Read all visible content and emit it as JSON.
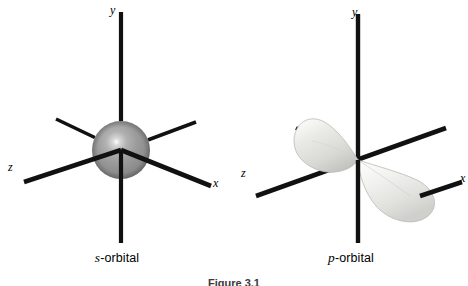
{
  "figure": {
    "background_color": "#ffffff",
    "caption": "Figure 3.1",
    "panels": [
      {
        "id": "s-orbital",
        "caption_italic": "s",
        "caption_rest": "-orbital",
        "orbital_type": "s",
        "shape": "sphere",
        "surface_color": "#9a9a9a",
        "highlight_color": "#ffffff",
        "axes": [
          {
            "name": "y",
            "label": "y",
            "label_x": 110,
            "label_y": 4
          },
          {
            "name": "z",
            "label": "z",
            "label_x": 8,
            "label_y": 161
          },
          {
            "name": "x",
            "label": "x",
            "label_x": 213,
            "label_y": 177
          }
        ]
      },
      {
        "id": "p-orbital",
        "caption_italic": "p",
        "caption_rest": "-orbital",
        "orbital_type": "p",
        "shape": "two-lobes",
        "surface_color": "#e8e8e6",
        "highlight_color": "#ffffff",
        "axes": [
          {
            "name": "y",
            "label": "y",
            "label_x": 118,
            "label_y": 6
          },
          {
            "name": "z",
            "label": "z",
            "label_x": 7,
            "label_y": 167
          },
          {
            "name": "x",
            "label": "x",
            "label_x": 226,
            "label_y": 172
          }
        ]
      }
    ],
    "axis_line_color": "#111111"
  }
}
